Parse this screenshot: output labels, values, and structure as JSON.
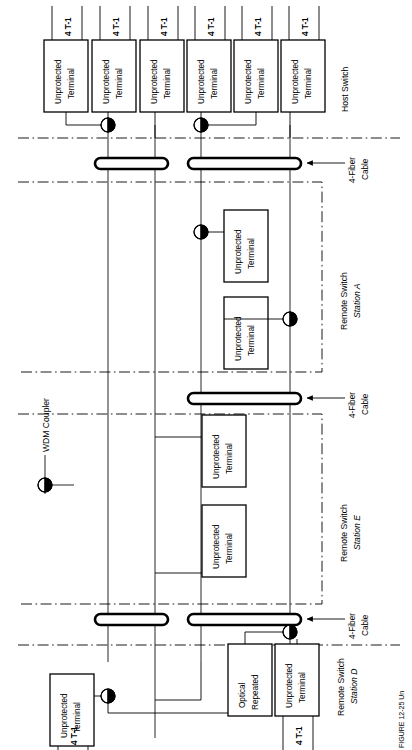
{
  "figure": {
    "type": "network-topology-diagram",
    "orientation": "rotated-90-ccw",
    "caption_partial": "FIGURE 12-25  Un"
  },
  "labels": {
    "terminal": "Unprotected\nTerminal",
    "terminal_line1": "Unprotected",
    "terminal_line2": "Terminal",
    "tributary": "4 T-1",
    "host_switch": "Host Switch",
    "fiber_cable_line1": "4-Fiber",
    "fiber_cable_line2": "Cable",
    "wdm_coupler": "WDM Coupler",
    "optical_repeater_line1": "Optical",
    "optical_repeater_line2": "Repeated",
    "station_a_line1": "Remote Switch",
    "station_a_line2": "Station A",
    "station_e_line1": "Remote Switch",
    "station_e_line2": "Station E",
    "station_d_line1": "Remote Switch",
    "station_d_line2": "Station D"
  },
  "stations": [
    {
      "id": "host",
      "name": "Host Switch",
      "terminal_count": 6,
      "tributaries": [
        "4 T-1",
        "4 T-1",
        "4 T-1",
        "4 T-1",
        "4 T-1",
        "4 T-1"
      ],
      "wdm_couplers": 2
    },
    {
      "id": "station-a",
      "name": "Remote Switch Station A",
      "name_line1": "Remote Switch",
      "name_line2": "Station A",
      "terminal_count": 2,
      "wdm_couplers": 2
    },
    {
      "id": "station-e",
      "name": "Remote Switch Station E",
      "name_line1": "Remote Switch",
      "name_line2": "Station E",
      "terminal_count": 2,
      "wdm_couplers": 0
    },
    {
      "id": "station-d",
      "name": "Remote Switch Station D",
      "name_line1": "Remote Switch",
      "name_line2": "Station D",
      "terminal_count": 2,
      "tributaries": [
        "4 T-1",
        "4 T-1"
      ],
      "optical_repeater": "Optical Repeated",
      "wdm_couplers": 2
    }
  ],
  "cables": [
    {
      "id": "cable-1",
      "label_line1": "4-Fiber",
      "label_line2": "Cable"
    },
    {
      "id": "cable-2",
      "label_line1": "4-Fiber",
      "label_line2": "Cable"
    },
    {
      "id": "cable-3",
      "label_line1": "4-Fiber",
      "label_line2": "Cable"
    }
  ],
  "legend": {
    "symbol": "WDM Coupler",
    "symbol_name": "wdm-coupler-symbol"
  },
  "colors": {
    "stroke": "#000000",
    "fill": "#ffffff"
  }
}
